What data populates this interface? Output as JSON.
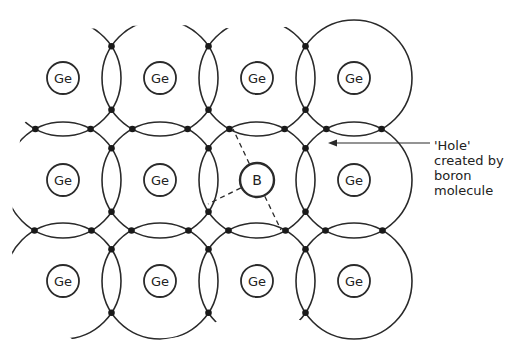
{
  "diagram": {
    "grid": {
      "columns_x": [
        63,
        160,
        257,
        354
      ],
      "rows_y": [
        78,
        180,
        281
      ],
      "bond_circle_radius": 58,
      "atom_circle_radius": 16
    },
    "atoms": [
      {
        "row": 0,
        "col": 0,
        "symbol": "Ge"
      },
      {
        "row": 0,
        "col": 1,
        "symbol": "Ge"
      },
      {
        "row": 0,
        "col": 2,
        "symbol": "Ge"
      },
      {
        "row": 0,
        "col": 3,
        "symbol": "Ge"
      },
      {
        "row": 1,
        "col": 0,
        "symbol": "Ge"
      },
      {
        "row": 1,
        "col": 1,
        "symbol": "Ge"
      },
      {
        "row": 1,
        "col": 2,
        "symbol": "B"
      },
      {
        "row": 1,
        "col": 3,
        "symbol": "Ge"
      },
      {
        "row": 2,
        "col": 0,
        "symbol": "Ge"
      },
      {
        "row": 2,
        "col": 1,
        "symbol": "Ge"
      },
      {
        "row": 2,
        "col": 2,
        "symbol": "Ge"
      },
      {
        "row": 2,
        "col": 3,
        "symbol": "Ge"
      }
    ],
    "annotation": {
      "lines": [
        "'Hole'",
        "created by",
        "boron",
        "molecule"
      ],
      "arrow_from": [
        430,
        143
      ],
      "arrow_to": [
        328,
        143
      ]
    },
    "colors": {
      "stroke": "#2a2a2a",
      "background": "#ffffff"
    }
  }
}
